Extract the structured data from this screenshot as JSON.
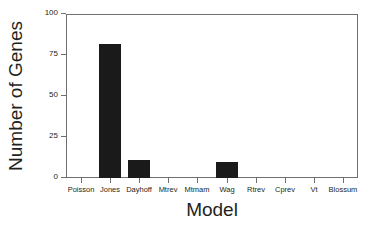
{
  "chart_data": {
    "type": "bar",
    "title": "",
    "xlabel": "Model",
    "ylabel": "Number of Genes",
    "categories": [
      "Poisson",
      "Jones",
      "Dayhoff",
      "Mtrev",
      "Mtmam",
      "Wag",
      "Rtrev",
      "Cprev",
      "Vt",
      "Blossum"
    ],
    "values": [
      0,
      82,
      11,
      0,
      0,
      10,
      0,
      0,
      0,
      0
    ],
    "ylim": [
      0,
      100
    ],
    "yticks": [
      0,
      25,
      50,
      75,
      100
    ],
    "ytick_labels": [
      "0",
      "25",
      "50",
      "75",
      "100"
    ],
    "grid": false,
    "legend": null,
    "bar_color": "#1a1a1a",
    "axis_color": "#6f6f6f",
    "text_color": "#231f20",
    "background": "#ffffff"
  }
}
